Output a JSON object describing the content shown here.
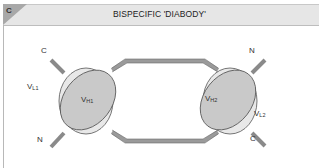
{
  "panel": {
    "letter": "C",
    "title": "BISPECIFIC 'DIABODY'"
  },
  "diagram": {
    "type": "protein-domain-schematic",
    "left_unit": {
      "heavy_domain": {
        "main": "V",
        "sub": "H1"
      },
      "light_domain": {
        "main": "V",
        "sub": "L1"
      },
      "top_terminus": "C",
      "bottom_terminus": "N"
    },
    "right_unit": {
      "heavy_domain": {
        "main": "V",
        "sub": "H2"
      },
      "light_domain": {
        "main": "V",
        "sub": "L2"
      },
      "top_terminus": "N",
      "bottom_terminus": "C"
    },
    "colors": {
      "heavy_fill": "#c9c9c9",
      "light_fill": "#e8e8e8",
      "outline": "#555555",
      "linker": "#9a9a9a",
      "header_bg": "#e6e6e6",
      "tag_dark": "#9e9e9e"
    }
  }
}
